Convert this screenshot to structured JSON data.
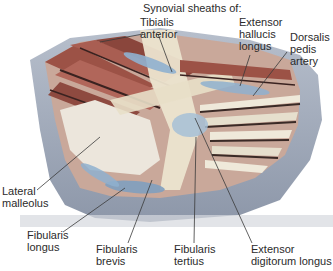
{
  "figure": {
    "title": "Synovial sheaths of:",
    "labels": {
      "tibialis_anterior": "Tibialis\nanterior",
      "extensor_hallucis_longus": "Extensor\nhallucis\nlongus",
      "dorsalis_pedis_artery": "Dorsalis\npedis\nartery",
      "lateral_malleolus": "Lateral\nmalleolus",
      "fibularis_longus": "Fibularis\nlongus",
      "fibularis_brevis": "Fibularis\nbrevis",
      "fibularis_tertius": "Fibularis\ntertius",
      "extensor_digitorum_longus": "Extensor\ndigitorum longus"
    },
    "colors": {
      "skin": "#9aa3b4",
      "muscle": "#a0574c",
      "tendon": "#e8e2cf",
      "sheath": "#8fb0cf",
      "leader": "#3a3a3a"
    }
  }
}
